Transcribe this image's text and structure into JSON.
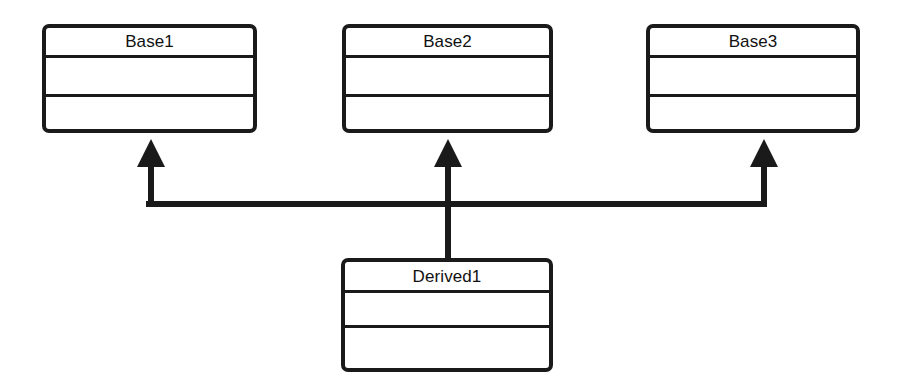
{
  "diagram": {
    "type": "uml-class-diagram",
    "background_color": "#ffffff",
    "line_color": "#1a1a1a",
    "text_color": "#111111",
    "classes": [
      {
        "id": "base1",
        "name": "Base1",
        "role": "base-class",
        "x": 42,
        "y": 24,
        "width": 215,
        "height": 109,
        "name_cell_height": 33,
        "attributes_cell_height": 39,
        "attributes": [],
        "operations": []
      },
      {
        "id": "base2",
        "name": "Base2",
        "role": "base-class",
        "x": 342,
        "y": 24,
        "width": 211,
        "height": 109,
        "name_cell_height": 33,
        "attributes_cell_height": 39,
        "attributes": [],
        "operations": []
      },
      {
        "id": "base3",
        "name": "Base3",
        "role": "base-class",
        "x": 646,
        "y": 24,
        "width": 214,
        "height": 109,
        "name_cell_height": 33,
        "attributes_cell_height": 39,
        "attributes": [],
        "operations": []
      },
      {
        "id": "derived1",
        "name": "Derived1",
        "role": "derived-class",
        "x": 341,
        "y": 258,
        "width": 212,
        "height": 114,
        "name_cell_height": 34,
        "attributes_cell_height": 35,
        "attributes": [],
        "operations": []
      }
    ],
    "relationships": [
      {
        "id": "derived1-to-base1",
        "type": "generalization",
        "source": "derived1",
        "target": "base1",
        "arrow": "filled-triangle"
      },
      {
        "id": "derived1-to-base2",
        "type": "generalization",
        "source": "derived1",
        "target": "base2",
        "arrow": "filled-triangle"
      },
      {
        "id": "derived1-to-base3",
        "type": "generalization",
        "source": "derived1",
        "target": "base3",
        "arrow": "filled-triangle"
      }
    ],
    "connector_geometry": {
      "bus_y": 204,
      "bus_x_start": 143,
      "bus_x_end": 764,
      "stroke_width": 6,
      "arrow_tip_y": 139,
      "arrow_base_y": 166,
      "arrow_half_width": 14,
      "arrow_x_left": 151,
      "arrow_x_center": 448,
      "arrow_x_right": 764,
      "trunk_x": 448,
      "trunk_bottom_y": 258
    }
  }
}
